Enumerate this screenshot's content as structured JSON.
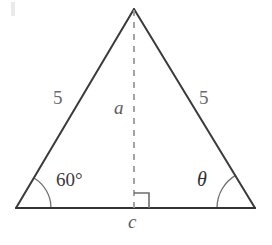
{
  "diagram": {
    "background_color": "#ffffff",
    "stroke_color": "#3a3a3c",
    "base_stroke_color": "#333335",
    "dashed_stroke_color": "#9a9a9c",
    "arc_stroke_color": "#6e6e70",
    "vertices": {
      "apex": {
        "x": 134,
        "y": 9
      },
      "bottom_left": {
        "x": 16,
        "y": 208
      },
      "bottom_right": {
        "x": 255,
        "y": 208
      },
      "foot": {
        "x": 134,
        "y": 208
      }
    },
    "altitude": {
      "style": "dashed",
      "from": {
        "x": 134,
        "y": 9
      },
      "to": {
        "x": 134,
        "y": 208
      }
    },
    "right_angle_marker": {
      "side": "right",
      "size": 15,
      "x": 134,
      "y": 193
    },
    "angle_arcs": [
      {
        "name": "left-angle-arc",
        "cx": 16,
        "cy": 208,
        "r": 35
      },
      {
        "name": "right-angle-arc",
        "cx": 255,
        "cy": 208,
        "r": 38
      }
    ],
    "labels": {
      "left_side": "5",
      "right_side": "5",
      "altitude": "a",
      "base": "c",
      "left_angle": "60°",
      "right_angle": "θ"
    }
  }
}
